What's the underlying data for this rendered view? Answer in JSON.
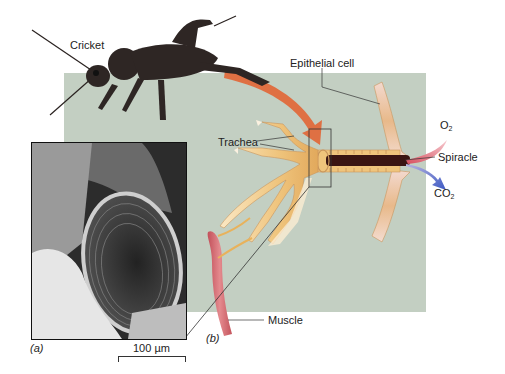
{
  "figure": {
    "panel_a_label": "(a)",
    "panel_b_label": "(b)",
    "scale_bar": "100 µm"
  },
  "labels": {
    "cricket": "Cricket",
    "epithelial_cell": "Epithelial cell",
    "trachea": "Trachea",
    "spiracle": "Spiracle",
    "muscle": "Muscle",
    "o2_main": "O",
    "o2_sub": "2",
    "co2_main": "CO",
    "co2_sub": "2"
  },
  "colors": {
    "background_panel": "#c3cfc2",
    "trachea": "#eec27a",
    "muscle": "#d9747a",
    "arrow_orange": "#e06a3c",
    "o2_arrow": "#e0606e",
    "co2_arrow": "#4a64c8",
    "cricket": "#2e2624"
  }
}
